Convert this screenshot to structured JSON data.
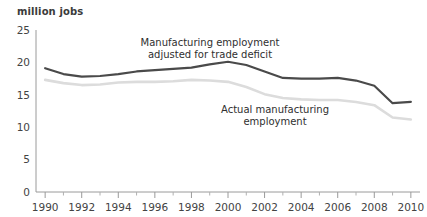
{
  "chart_data": {
    "type": "line",
    "title": "",
    "xlabel": "",
    "ylabel": "million jobs",
    "ylim": [
      0,
      25
    ],
    "xlim": [
      1989.5,
      2010.5
    ],
    "yticks": [
      0,
      5,
      10,
      15,
      20,
      25
    ],
    "xticks": [
      1990,
      1992,
      1994,
      1996,
      1998,
      2000,
      2002,
      2004,
      2006,
      2008,
      2010
    ],
    "xticks_minor": [
      1991,
      1993,
      1995,
      1997,
      1999,
      2001,
      2003,
      2005,
      2007,
      2009
    ],
    "grid": false,
    "legend_position": "inline-annotations",
    "x": [
      1990,
      1991,
      1992,
      1993,
      1994,
      1995,
      1996,
      1997,
      1998,
      1999,
      2000,
      2001,
      2002,
      2003,
      2004,
      2005,
      2006,
      2007,
      2008,
      2009,
      2010
    ],
    "series": [
      {
        "name": "Manufacturing employment adjusted for trade deficit",
        "color": "#4a4a4a",
        "values": [
          19.1,
          18.2,
          17.8,
          17.9,
          18.2,
          18.6,
          18.8,
          19.0,
          19.2,
          19.7,
          20.1,
          19.6,
          18.6,
          17.6,
          17.5,
          17.5,
          17.6,
          17.2,
          16.4,
          13.7,
          13.9
        ]
      },
      {
        "name": "Actual manufacturing employment",
        "color": "#dcdcdc",
        "values": [
          17.3,
          16.8,
          16.5,
          16.6,
          16.9,
          17.0,
          17.0,
          17.1,
          17.3,
          17.2,
          17.0,
          16.2,
          15.1,
          14.5,
          14.3,
          14.2,
          14.2,
          13.9,
          13.4,
          11.5,
          11.2
        ]
      }
    ],
    "annotations": [
      {
        "name": "adjusted-series-annotation",
        "lines": [
          "Manufacturing employment",
          "adjusted for trade deficit"
        ],
        "x": 210,
        "y": 46
      },
      {
        "name": "actual-series-annotation",
        "lines": [
          "Actual manufacturing",
          "employment"
        ],
        "x": 275,
        "y": 113
      }
    ]
  }
}
